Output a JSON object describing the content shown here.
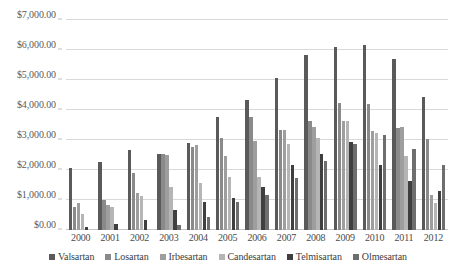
{
  "chart_data": {
    "type": "bar",
    "title": "",
    "xlabel": "",
    "ylabel": "",
    "grid": true,
    "legend_position": "bottom",
    "ylim": [
      0,
      7000
    ],
    "ytick_values": [
      7000,
      6000,
      5000,
      4000,
      3000,
      2000,
      1000,
      0
    ],
    "ytick_labels": [
      "$7,000.00",
      "$6,000.00",
      "$5,000.00",
      "$4,000.00",
      "$3,000.00",
      "$2,000.00",
      "$1,000.00",
      "$0.00"
    ],
    "categories": [
      "2000",
      "2001",
      "2002",
      "2003",
      "2004",
      "2005",
      "2006",
      "2007",
      "2008",
      "2009",
      "2010",
      "2011",
      "2012"
    ],
    "series": [
      {
        "name": "Valsartan",
        "color": "#5a5a5a",
        "values": [
          2080,
          2270,
          2680,
          2520,
          2900,
          3780,
          4350,
          5080,
          5820,
          6110,
          6180,
          5700,
          4420
        ]
      },
      {
        "name": "Losartan",
        "color": "#8a8a8a",
        "values": [
          760,
          1000,
          1900,
          2550,
          2760,
          3060,
          3780,
          3330,
          3630,
          4250,
          4190,
          3400,
          3030
        ]
      },
      {
        "name": "Irbesartan",
        "color": "#9e9e9e",
        "values": [
          900,
          820,
          1230,
          2500,
          2830,
          2470,
          2970,
          3340,
          3430,
          3640,
          3300,
          3450,
          1180
        ]
      },
      {
        "name": "Candesartan",
        "color": "#b5b5b5",
        "values": [
          520,
          780,
          1140,
          1430,
          1580,
          1780,
          1760,
          2880,
          3060,
          3620,
          3230,
          2460,
          910
        ]
      },
      {
        "name": "Telmisartan",
        "color": "#3f3f3f",
        "values": [
          95,
          190,
          340,
          660,
          940,
          1080,
          1430,
          2180,
          2550,
          2930,
          2170,
          1640,
          1310
        ]
      },
      {
        "name": "Olmesartan",
        "color": "#6e6e6e",
        "values": [
          0,
          0,
          0,
          180,
          420,
          930,
          1180,
          1720,
          2310,
          2870,
          3170,
          2700,
          2180
        ]
      }
    ]
  },
  "legend": {
    "items": [
      {
        "label": "Valsartan"
      },
      {
        "label": "Losartan"
      },
      {
        "label": "Irbesartan"
      },
      {
        "label": "Candesartan"
      },
      {
        "label": "Telmisartan"
      },
      {
        "label": "Olmesartan"
      }
    ]
  }
}
